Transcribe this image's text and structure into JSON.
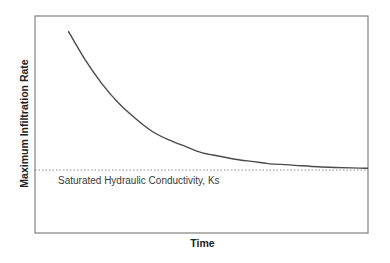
{
  "chart_data": {
    "type": "line",
    "title": "",
    "xlabel": "Time",
    "ylabel": "Maximum Infiltration Rate",
    "xlim": [
      0,
      1
    ],
    "ylim": [
      0,
      1
    ],
    "grid": false,
    "legend": "none",
    "x_ticks": [],
    "y_ticks": [],
    "series": [
      {
        "name": "Infiltration capacity",
        "color": "#4a4a4a",
        "style": "solid",
        "x": [
          0.1,
          0.15,
          0.2,
          0.25,
          0.3,
          0.35,
          0.4,
          0.45,
          0.5,
          0.55,
          0.6,
          0.65,
          0.7,
          0.75,
          0.8,
          0.85,
          0.9,
          0.95,
          1.0
        ],
        "y": [
          0.93,
          0.8,
          0.69,
          0.6,
          0.53,
          0.47,
          0.43,
          0.4,
          0.37,
          0.355,
          0.34,
          0.33,
          0.32,
          0.315,
          0.31,
          0.305,
          0.302,
          0.3,
          0.298
        ]
      }
    ],
    "reference_lines": [
      {
        "name": "Ks",
        "orientation": "horizontal",
        "y": 0.29,
        "style": "dotted",
        "color": "#8c8c8c",
        "label": "Saturated Hydraulic Conductivity, Ks"
      }
    ]
  }
}
